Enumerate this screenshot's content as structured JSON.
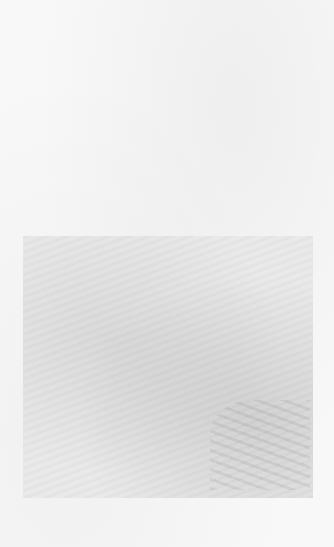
{
  "document": {
    "type": "scanned-page",
    "description": "Blank page with faint bleed-through of an image region",
    "visible_text": ""
  },
  "colors": {
    "paper": "#f8f8f8",
    "bleed": "#e9e9e9"
  }
}
